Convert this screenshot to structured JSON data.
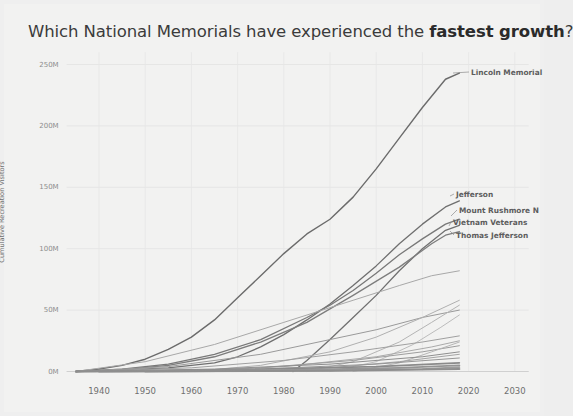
{
  "chart": {
    "title_prefix": "Which National Memorials have experienced the ",
    "title_emphasis": "fastest growth",
    "title_suffix": "?"
  },
  "chart_data": {
    "type": "line",
    "title": "Which National Memorials have experienced the fastest growth?",
    "xlabel": "",
    "ylabel": "Cumulative Recreation Visitors",
    "xlim": [
      1933,
      2033
    ],
    "ylim": [
      0,
      260000000
    ],
    "xticks": [
      1940,
      1950,
      1960,
      1970,
      1980,
      1990,
      2000,
      2010,
      2020,
      2030
    ],
    "xtick_labels": [
      "1940",
      "1950",
      "1960",
      "1970",
      "1980",
      "1990",
      "2000",
      "2010",
      "2020",
      "2030"
    ],
    "yticks": [
      0,
      50000000,
      100000000,
      150000000,
      200000000,
      250000000
    ],
    "ytick_labels": [
      "0M",
      "50M",
      "100M",
      "150M",
      "200M",
      "250M"
    ],
    "grid": true,
    "legend": "inline-end-labels",
    "series": [
      {
        "name": "Lincoln Memorial",
        "label": "Lincoln Memorial",
        "labeled": true,
        "color": "#6b6b6b",
        "width": 1.4,
        "x": [
          1935,
          1940,
          1945,
          1950,
          1955,
          1960,
          1965,
          1970,
          1975,
          1980,
          1985,
          1990,
          1995,
          2000,
          2005,
          2010,
          2015,
          2018
        ],
        "y": [
          0,
          2000000,
          5000000,
          10000000,
          18000000,
          28000000,
          42000000,
          60000000,
          78000000,
          96000000,
          112000000,
          124000000,
          142000000,
          165000000,
          190000000,
          215000000,
          238000000,
          243000000
        ]
      },
      {
        "name": "Jefferson",
        "label": "Jefferson",
        "labeled": true,
        "color": "#6f6f6f",
        "width": 1.3,
        "x": [
          1935,
          1945,
          1955,
          1965,
          1970,
          1975,
          1980,
          1985,
          1990,
          1995,
          2000,
          2005,
          2010,
          2015,
          2018
        ],
        "y": [
          0,
          1000000,
          3000000,
          7000000,
          12000000,
          20000000,
          30000000,
          42000000,
          55000000,
          70000000,
          86000000,
          104000000,
          120000000,
          134000000,
          139000000
        ]
      },
      {
        "name": "Mount Rushmore N",
        "label": "Mount Rushmore N",
        "labeled": true,
        "color": "#787878",
        "width": 1.3,
        "x": [
          1935,
          1945,
          1955,
          1965,
          1975,
          1985,
          1990,
          1995,
          2000,
          2005,
          2010,
          2015,
          2018
        ],
        "y": [
          0,
          2000000,
          6000000,
          14000000,
          26000000,
          44000000,
          54000000,
          66000000,
          80000000,
          95000000,
          108000000,
          120000000,
          124000000
        ]
      },
      {
        "name": "Vietnam Veterans",
        "label": "Vietnam Veterans",
        "labeled": true,
        "color": "#707070",
        "width": 1.3,
        "x": [
          1982,
          1985,
          1990,
          1995,
          2000,
          2005,
          2010,
          2015,
          2018
        ],
        "y": [
          0,
          9000000,
          26000000,
          44000000,
          62000000,
          82000000,
          100000000,
          115000000,
          119000000
        ]
      },
      {
        "name": "Thomas Jefferson",
        "label": "Thomas Jefferson",
        "labeled": true,
        "color": "#7d7d7d",
        "width": 1.3,
        "x": [
          1935,
          1945,
          1955,
          1965,
          1975,
          1985,
          1995,
          2005,
          2012,
          2015,
          2018
        ],
        "y": [
          0,
          1500000,
          5000000,
          12000000,
          24000000,
          40000000,
          62000000,
          85000000,
          104000000,
          111000000,
          114000000
        ]
      },
      {
        "name": "series-6",
        "labeled": false,
        "color": "#a8a8a8",
        "width": 1.0,
        "x": [
          1935,
          1950,
          1965,
          1980,
          1995,
          2005,
          2012,
          2018
        ],
        "y": [
          0,
          8000000,
          22000000,
          40000000,
          58000000,
          70000000,
          78000000,
          82000000
        ]
      },
      {
        "name": "series-7",
        "labeled": false,
        "color": "#9a9a9a",
        "width": 1.0,
        "x": [
          1935,
          1955,
          1975,
          1990,
          2000,
          2010,
          2018
        ],
        "y": [
          0,
          4000000,
          14000000,
          26000000,
          34000000,
          44000000,
          50000000
        ]
      },
      {
        "name": "series-8",
        "labeled": false,
        "color": "#b0b0b0",
        "width": 1.0,
        "x": [
          1960,
          1975,
          1990,
          2000,
          2010,
          2018
        ],
        "y": [
          0,
          5000000,
          16000000,
          28000000,
          44000000,
          58000000
        ]
      },
      {
        "name": "series-9",
        "labeled": false,
        "color": "#b4b4b4",
        "width": 1.0,
        "x": [
          1985,
          1995,
          2005,
          2012,
          2018
        ],
        "y": [
          0,
          8000000,
          24000000,
          40000000,
          54000000
        ]
      },
      {
        "name": "series-10",
        "labeled": false,
        "color": "#bcbcbc",
        "width": 1.0,
        "x": [
          1990,
          2000,
          2008,
          2014,
          2018
        ],
        "y": [
          0,
          8000000,
          22000000,
          36000000,
          46000000
        ]
      },
      {
        "name": "series-11",
        "labeled": false,
        "color": "#a0a0a0",
        "width": 1.0,
        "x": [
          1935,
          1960,
          1980,
          1995,
          2010,
          2018
        ],
        "y": [
          0,
          3000000,
          9000000,
          16000000,
          24000000,
          29000000
        ]
      },
      {
        "name": "series-12",
        "labeled": false,
        "color": "#aaaaaa",
        "width": 1.0,
        "x": [
          1960,
          1980,
          2000,
          2012,
          2018
        ],
        "y": [
          0,
          4000000,
          12000000,
          20000000,
          25000000
        ]
      },
      {
        "name": "series-13",
        "labeled": false,
        "color": "#9e9e9e",
        "width": 1.0,
        "x": [
          1955,
          1975,
          1995,
          2010,
          2018
        ],
        "y": [
          0,
          3000000,
          9000000,
          16000000,
          21000000
        ]
      },
      {
        "name": "series-14",
        "labeled": false,
        "color": "#b6b6b6",
        "width": 1.0,
        "x": [
          1995,
          2005,
          2012,
          2018
        ],
        "y": [
          0,
          7000000,
          16000000,
          24000000
        ]
      },
      {
        "name": "series-15",
        "labeled": false,
        "color": "#8f8f8f",
        "width": 1.0,
        "x": [
          1935,
          1965,
          1990,
          2010,
          2018
        ],
        "y": [
          0,
          2000000,
          6000000,
          12000000,
          16000000
        ]
      },
      {
        "name": "series-16",
        "labeled": false,
        "color": "#a4a4a4",
        "width": 1.0,
        "x": [
          1970,
          1990,
          2005,
          2018
        ],
        "y": [
          0,
          3000000,
          8000000,
          14000000
        ]
      },
      {
        "name": "series-17",
        "labeled": false,
        "color": "#969696",
        "width": 1.0,
        "x": [
          1945,
          1975,
          2000,
          2018
        ],
        "y": [
          0,
          2000000,
          6000000,
          11000000
        ]
      },
      {
        "name": "series-18",
        "labeled": false,
        "color": "#8a8a8a",
        "width": 1.6,
        "x": [
          1935,
          1970,
          2000,
          2018
        ],
        "y": [
          0,
          1500000,
          4000000,
          7000000
        ]
      },
      {
        "name": "series-19",
        "labeled": false,
        "color": "#949494",
        "width": 1.8,
        "x": [
          1940,
          1980,
          2005,
          2018
        ],
        "y": [
          0,
          1200000,
          3000000,
          5000000
        ]
      },
      {
        "name": "series-20",
        "labeled": false,
        "color": "#9c9c9c",
        "width": 1.8,
        "x": [
          1950,
          1985,
          2010,
          2018
        ],
        "y": [
          0,
          800000,
          2000000,
          3500000
        ]
      },
      {
        "name": "series-21",
        "labeled": false,
        "color": "#8e8e8e",
        "width": 2.0,
        "x": [
          1935,
          1990,
          2018
        ],
        "y": [
          0,
          700000,
          2000000
        ]
      }
    ]
  }
}
